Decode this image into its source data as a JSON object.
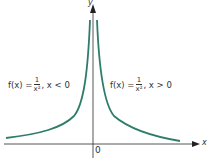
{
  "diagram": {
    "axis_labels": {
      "x": "x",
      "y": "y"
    },
    "origin_label": "0",
    "left_label": {
      "prefix": "f(x) =",
      "numerator": "1",
      "denominator": "x²",
      "suffix": ", x < 0"
    },
    "right_label": {
      "prefix": "f(x) =",
      "numerator": "1",
      "denominator": "x²",
      "suffix": ", x > 0"
    },
    "colors": {
      "curve": "#2e7d6b",
      "axis": "#444444",
      "text": "#333333"
    }
  }
}
